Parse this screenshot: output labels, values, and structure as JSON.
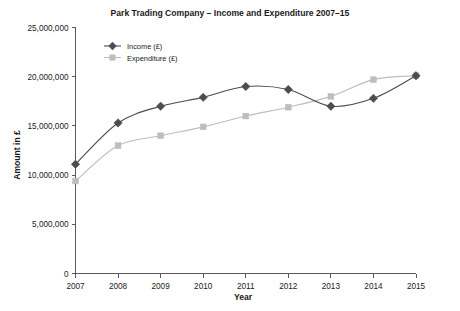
{
  "chart_data": {
    "type": "line",
    "title": "Park Trading Company – Income and Expenditure 2007–15",
    "xlabel": "Year",
    "ylabel": "Amount in £",
    "grid": false,
    "legend_position": "top-left",
    "categories": [
      "2007",
      "2008",
      "2009",
      "2010",
      "2011",
      "2012",
      "2013",
      "2014",
      "2015"
    ],
    "x": [
      2007,
      2008,
      2009,
      2010,
      2011,
      2012,
      2013,
      2014,
      2015
    ],
    "xlim": [
      2007,
      2015
    ],
    "ylim": [
      0,
      25000000
    ],
    "ytick_labels": [
      "0",
      "5,000,000",
      "10,000,000",
      "15,000,000",
      "20,000,000",
      "25,000,000"
    ],
    "yticks": [
      0,
      5000000,
      10000000,
      15000000,
      20000000,
      25000000
    ],
    "series": [
      {
        "name": "Income (£)",
        "marker": "diamond",
        "color": "#4d4d4d",
        "values": [
          11100000,
          15300000,
          17000000,
          17900000,
          19000000,
          18700000,
          17000000,
          17800000,
          20100000
        ]
      },
      {
        "name": "Expenditure (£)",
        "marker": "square",
        "color": "#bdbdbd",
        "values": [
          9400000,
          13000000,
          14000000,
          14900000,
          16000000,
          16900000,
          18000000,
          19700000,
          20100000
        ]
      }
    ]
  },
  "legend": {
    "items": [
      {
        "label": "Income (£)"
      },
      {
        "label": "Expenditure (£)"
      }
    ]
  }
}
